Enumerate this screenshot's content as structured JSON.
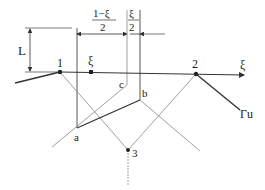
{
  "diagram": {
    "labels": {
      "L": "L",
      "point1": "1",
      "point2": "2",
      "point3": "3",
      "xi_point": "ξ",
      "xi_axis": "ξ",
      "a": "a",
      "b": "b",
      "c": "c",
      "gamma_u": "Γu",
      "dim_left_num": "1−ξ",
      "dim_left_den": "2",
      "dim_right_num": "ξ",
      "dim_right_den": "2"
    },
    "colors": {
      "thick_line": "#333333",
      "thin_line": "#888888",
      "text": "#222222",
      "background": "#ffffff"
    }
  }
}
